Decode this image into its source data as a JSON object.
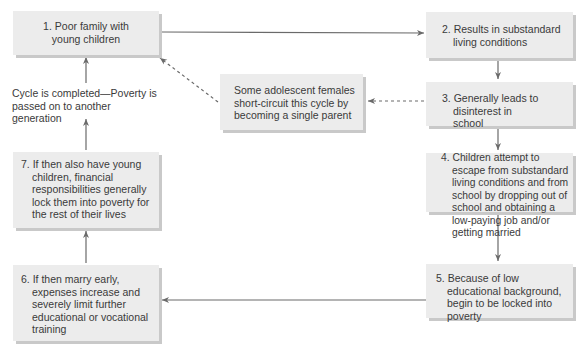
{
  "diagram": {
    "type": "cycle-flowchart",
    "colors": {
      "box_fill": "#ececec",
      "box_shadow": "#c9c9c9",
      "arrow": "#6a6a6a",
      "text": "#3a3a3a"
    },
    "steps": [
      {
        "id": 1,
        "text": "1. Poor family with young children"
      },
      {
        "id": 2,
        "text": "2. Results in substandard living conditions"
      },
      {
        "id": 3,
        "text": "3. Generally leads to disinterest in school"
      },
      {
        "id": 4,
        "text": "4. Children attempt to escape from substandard living conditions and from school by dropping out of school and obtaining a low-paying job and/or getting married"
      },
      {
        "id": 5,
        "text": "5. Because of low educational background, begin to be locked into poverty"
      },
      {
        "id": 6,
        "text": "6. If then marry early, expenses increase and severely limit further educational or vocational training"
      },
      {
        "id": 7,
        "text": "7. If then also have young children, financial responsibilities generally lock them into poverty for the rest of their lives"
      }
    ],
    "side_note": "Some adolescent females short-circuit this cycle by becoming a single parent",
    "cycle_label": "Cycle is completed—Poverty is passed on to another generation",
    "flows": [
      {
        "from": 1,
        "to": 2,
        "style": "solid"
      },
      {
        "from": 2,
        "to": 3,
        "style": "solid"
      },
      {
        "from": 3,
        "to": 4,
        "style": "solid"
      },
      {
        "from": 4,
        "to": 5,
        "style": "solid"
      },
      {
        "from": 5,
        "to": 6,
        "style": "solid"
      },
      {
        "from": 6,
        "to": 7,
        "style": "solid"
      },
      {
        "from": 7,
        "to": "cycle_label",
        "style": "solid"
      },
      {
        "from": "cycle_label",
        "to": 1,
        "style": "solid"
      },
      {
        "from": 3,
        "to": "side_note",
        "style": "dashed"
      },
      {
        "from": "side_note",
        "to": 1,
        "style": "dashed"
      }
    ]
  }
}
